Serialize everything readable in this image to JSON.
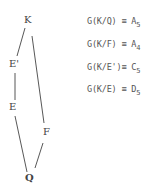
{
  "lattice": {
    "nodes": [
      {
        "id": "K",
        "label": "K"
      },
      {
        "id": "E_prime",
        "label": "E'"
      },
      {
        "id": "E",
        "label": "E"
      },
      {
        "id": "F",
        "label": "F"
      },
      {
        "id": "Q",
        "label": "Q"
      }
    ],
    "edges": [
      [
        "K",
        "E_prime"
      ],
      [
        "E_prime",
        "E"
      ],
      [
        "E",
        "Q"
      ],
      [
        "K",
        "F"
      ],
      [
        "F",
        "Q"
      ]
    ]
  },
  "equations": [
    {
      "lhs": "G(K/Q) ≡ A",
      "sub": "5"
    },
    {
      "lhs": "G(K/F) ≡ A",
      "sub": "4"
    },
    {
      "lhs": "G(K/E')≡ C",
      "sub": "5"
    },
    {
      "lhs": "G(K/E) ≡ D",
      "sub": "5"
    }
  ]
}
